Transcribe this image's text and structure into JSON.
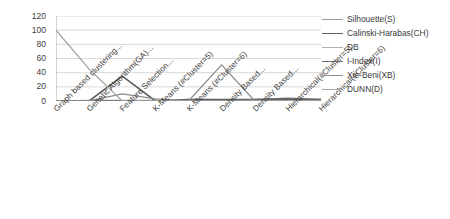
{
  "chart_data": {
    "type": "line",
    "title": "",
    "xlabel": "",
    "ylabel": "",
    "ylim": [
      0,
      120
    ],
    "yticks": [
      0,
      20,
      40,
      60,
      80,
      100,
      120
    ],
    "grid": true,
    "legend_position": "right",
    "categories": [
      "Graph based clustering...",
      "Genetic Algorithm(GA)...",
      "Feature Selection...",
      "K-Means (#Cluster=5)",
      "K-Means (#Cluster=6)",
      "Density Based...",
      "Density Based...",
      "Hierarchical(#Cluster=5)",
      "Hierarchical(#Cluster=6)"
    ],
    "series": [
      {
        "name": "Silhouette(S)",
        "color": "#9a9a9a",
        "width": 1.2,
        "values": [
          0,
          1,
          1,
          1,
          1,
          1,
          1,
          1,
          1
        ]
      },
      {
        "name": "Calinski-Harabas(CH)",
        "color": "#5d5d5d",
        "width": 1.6,
        "values": [
          0,
          0,
          35,
          0,
          2,
          2,
          2,
          2,
          2
        ]
      },
      {
        "name": "DB",
        "color": "#b0b0b0",
        "width": 1.1,
        "values": [
          0,
          0,
          0,
          0,
          0,
          0,
          0,
          0,
          0
        ]
      },
      {
        "name": "I-Index(I)",
        "color": "#6e6e6e",
        "width": 1.5,
        "values": [
          0,
          0,
          0,
          0,
          0,
          0,
          2,
          4,
          2
        ]
      },
      {
        "name": "Xie-Beni(XB)",
        "color": "#8c8c8c",
        "width": 1.3,
        "values": [
          0,
          0,
          10,
          3,
          0,
          51,
          0,
          0,
          0
        ]
      },
      {
        "name": "DUNN(D)",
        "color": "#a5a5a5",
        "width": 1.3,
        "values": [
          100,
          45,
          0,
          0,
          0,
          0,
          0,
          0,
          0
        ]
      }
    ]
  }
}
